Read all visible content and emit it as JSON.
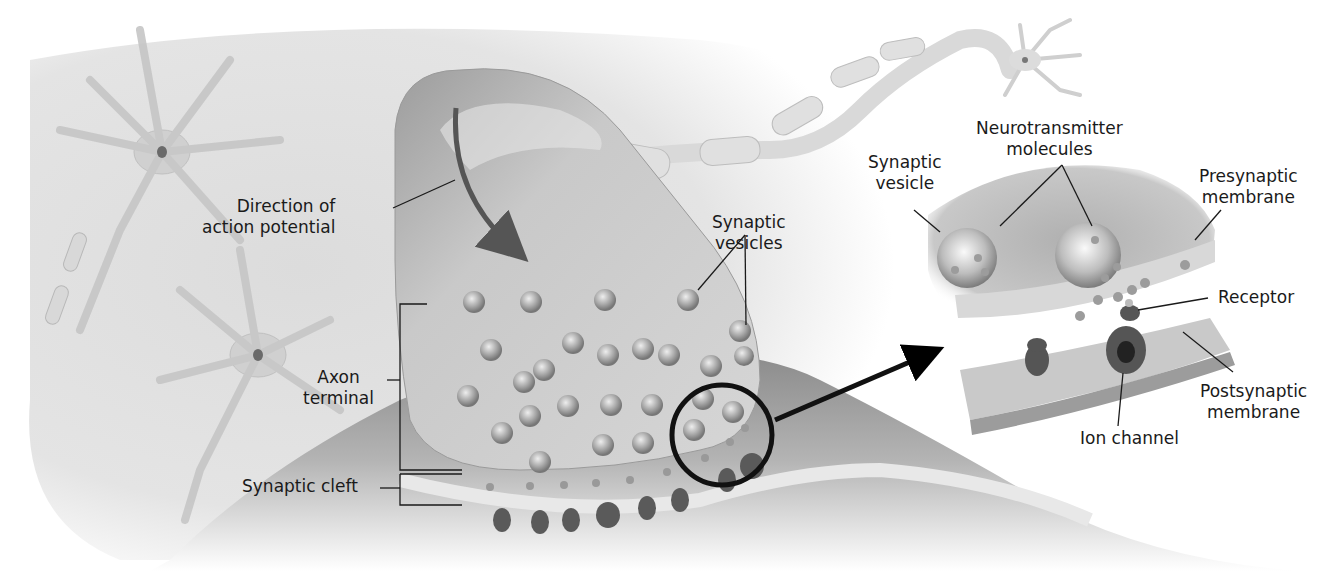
{
  "diagram": {
    "labels": {
      "direction": {
        "line1": "Direction of",
        "line2": "action potential"
      },
      "axon_terminal": {
        "line1": "Axon",
        "line2": "terminal"
      },
      "synaptic_cleft": "Synaptic cleft",
      "synaptic_vesicles": {
        "line1": "Synaptic",
        "line2": "vesicles"
      },
      "synaptic_vesicle": {
        "line1": "Synaptic",
        "line2": "vesicle"
      },
      "neurotransmitter": {
        "line1": "Neurotransmitter",
        "line2": "molecules"
      },
      "presynaptic": {
        "line1": "Presynaptic",
        "line2": "membrane"
      },
      "receptor": "Receptor",
      "postsynaptic": {
        "line1": "Postsynaptic",
        "line2": "membrane"
      },
      "ion_channel": "Ion channel"
    },
    "colors": {
      "tissue": "#bdbdbd",
      "tissue_dark": "#8c8c8c",
      "vesicle": "#a9a9a9",
      "receptor": "#5a5a5a",
      "line": "#1a1a1a",
      "arrow": "#555555"
    }
  }
}
